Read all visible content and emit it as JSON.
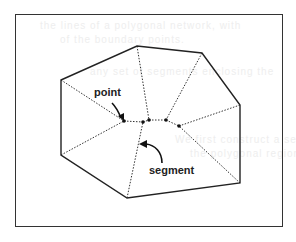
{
  "figure": {
    "labels": {
      "point": "point",
      "segment": "segment"
    },
    "outer_polygon": [
      [
        61,
        80
      ],
      [
        137,
        46
      ],
      [
        202,
        53
      ],
      [
        240,
        105
      ],
      [
        240,
        183
      ],
      [
        127,
        198
      ],
      [
        61,
        155
      ]
    ],
    "inner_points": [
      [
        124,
        121
      ],
      [
        143,
        122
      ],
      [
        149,
        120
      ],
      [
        166,
        120
      ],
      [
        179,
        126
      ]
    ],
    "segments": [
      [
        [
          61,
          80
        ],
        [
          124,
          121
        ]
      ],
      [
        [
          137,
          46
        ],
        [
          149,
          120
        ]
      ],
      [
        [
          202,
          53
        ],
        [
          166,
          120
        ]
      ],
      [
        [
          240,
          105
        ],
        [
          179,
          126
        ]
      ],
      [
        [
          240,
          183
        ],
        [
          179,
          126
        ]
      ],
      [
        [
          127,
          198
        ],
        [
          143,
          122
        ]
      ],
      [
        [
          61,
          155
        ],
        [
          124,
          121
        ]
      ],
      [
        [
          124,
          121
        ],
        [
          143,
          122
        ]
      ],
      [
        [
          143,
          122
        ],
        [
          149,
          120
        ]
      ],
      [
        [
          149,
          120
        ],
        [
          166,
          120
        ]
      ],
      [
        [
          166,
          120
        ],
        [
          179,
          126
        ]
      ]
    ]
  },
  "background_text": [
    "the lines of a polygonal network, with",
    "of the boundary points.",
    "any set of segments enclosing the",
    "We first construct a set of line segments",
    "the polygonal region. We call the",
    "segments that surround the inner points",
    "inner segments whose endpoints are"
  ]
}
